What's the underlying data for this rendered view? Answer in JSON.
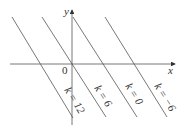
{
  "diagram": {
    "axes": {
      "x_label": "x",
      "y_label": "y",
      "origin_label": "0"
    },
    "lines": [
      {
        "id": "k12",
        "label": "k = 12",
        "x1": 12,
        "y1": 17,
        "x2": 73,
        "y2": 118,
        "lx": 64,
        "ly": 90
      },
      {
        "id": "k6",
        "label": "k = 6",
        "x1": 42,
        "y1": 17,
        "x2": 106,
        "y2": 117,
        "lx": 94,
        "ly": 88
      },
      {
        "id": "k0",
        "label": "k = 0",
        "x1": 73,
        "y1": 17,
        "x2": 137,
        "y2": 117,
        "lx": 125,
        "ly": 86
      },
      {
        "id": "km6",
        "label": "k = −6",
        "x1": 105,
        "y1": 17,
        "x2": 167,
        "y2": 117,
        "lx": 154,
        "ly": 86
      }
    ],
    "colors": {
      "line": "#555555",
      "axis": "#555555",
      "text": "#333333"
    }
  }
}
